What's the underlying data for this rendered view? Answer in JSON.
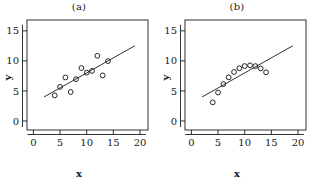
{
  "figure": {
    "background": "#ffffff",
    "ink_color": "#1a1a1a",
    "marker": "open-circle",
    "panels": [
      "a",
      "b"
    ]
  },
  "panel_a": {
    "title": "(a)",
    "xlabel": "x",
    "ylabel": "y"
  },
  "panel_b": {
    "title": "(b)",
    "xlabel": "x",
    "ylabel": "y"
  },
  "chart_data": [
    {
      "type": "scatter",
      "title": "(a)",
      "xlabel": "x",
      "ylabel": "y",
      "xlim": [
        -1.2,
        21.5
      ],
      "ylim": [
        -1.5,
        16.8
      ],
      "xticks": [
        0,
        5,
        10,
        15,
        20
      ],
      "yticks": [
        0,
        5,
        10,
        15
      ],
      "xtick_labels": [
        "0",
        "5",
        "10",
        "15",
        "20"
      ],
      "ytick_labels": [
        "0",
        "5",
        "10",
        "15"
      ],
      "grid": false,
      "legend": false,
      "marker": "open-circle",
      "points": [
        {
          "x": 10.0,
          "y": 8.04
        },
        {
          "x": 8.0,
          "y": 6.95
        },
        {
          "x": 13.0,
          "y": 7.58
        },
        {
          "x": 9.0,
          "y": 8.81
        },
        {
          "x": 11.0,
          "y": 8.33
        },
        {
          "x": 14.0,
          "y": 9.96
        },
        {
          "x": 6.0,
          "y": 7.24
        },
        {
          "x": 4.0,
          "y": 4.26
        },
        {
          "x": 12.0,
          "y": 10.84
        },
        {
          "x": 7.0,
          "y": 4.82
        },
        {
          "x": 5.0,
          "y": 5.68
        }
      ],
      "fit_line": {
        "type": "line",
        "slope": 0.5,
        "intercept": 3.0,
        "x_start": 2.0,
        "x_end": 19.0,
        "y_start": 4.0,
        "y_end": 12.5
      }
    },
    {
      "type": "scatter",
      "title": "(b)",
      "xlabel": "x",
      "ylabel": "y",
      "xlim": [
        -1.2,
        21.5
      ],
      "ylim": [
        -1.5,
        16.8
      ],
      "xticks": [
        0,
        5,
        10,
        15,
        20
      ],
      "yticks": [
        0,
        5,
        10,
        15
      ],
      "xtick_labels": [
        "0",
        "5",
        "10",
        "15",
        "20"
      ],
      "ytick_labels": [
        "0",
        "5",
        "10",
        "15"
      ],
      "grid": false,
      "legend": false,
      "marker": "open-circle",
      "points": [
        {
          "x": 10.0,
          "y": 9.14
        },
        {
          "x": 8.0,
          "y": 8.14
        },
        {
          "x": 13.0,
          "y": 8.74
        },
        {
          "x": 9.0,
          "y": 8.77
        },
        {
          "x": 11.0,
          "y": 9.26
        },
        {
          "x": 14.0,
          "y": 8.1
        },
        {
          "x": 6.0,
          "y": 6.13
        },
        {
          "x": 4.0,
          "y": 3.1
        },
        {
          "x": 12.0,
          "y": 9.13
        },
        {
          "x": 7.0,
          "y": 7.26
        },
        {
          "x": 5.0,
          "y": 4.74
        }
      ],
      "fit_line": {
        "type": "line",
        "slope": 0.5,
        "intercept": 3.0,
        "x_start": 2.0,
        "x_end": 19.0,
        "y_start": 4.0,
        "y_end": 12.5
      }
    }
  ]
}
